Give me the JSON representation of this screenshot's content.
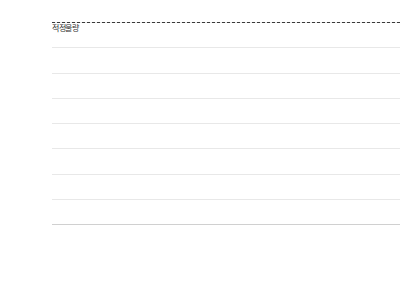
{
  "chart_data": {
    "type": "bar",
    "title": "",
    "xlabel": "",
    "ylabel": "",
    "ylim": [
      0,
      40000
    ],
    "ytick_step": 5000,
    "grid": true,
    "legend": "none",
    "bar_color": "#6b6b6b",
    "categories": [
      "2010년",
      "2011년",
      "2012년",
      "2013년",
      "2014년",
      "2015년",
      "2016년",
      "2017년",
      "2018년",
      "2019년",
      "2020년",
      "2021년",
      "2022년",
      "2023년",
      "2024년",
      "2025년",
      "2026년",
      "2027년",
      "2028년",
      "미정"
    ],
    "values": [
      9600,
      8000,
      4100,
      12100,
      5500,
      14200,
      21800,
      17400,
      11800,
      6300,
      13900,
      16600,
      19800,
      24600,
      23800,
      9800,
      6800,
      12000,
      3300,
      28000
    ],
    "ytick_labels": [
      "40,000",
      "35,000",
      "30,000",
      "25,000",
      "20,000",
      "15,000",
      "10,000",
      "5,000",
      "0"
    ],
    "ytick_values": [
      40000,
      35000,
      30000,
      25000,
      20000,
      15000,
      10000,
      5000,
      0
    ],
    "annotations": [
      {
        "name": "적정물량",
        "type": "horizontal-reference-line",
        "value": 11500,
        "style": "dashed",
        "color": "#3a3a3a",
        "label": "적정물량"
      }
    ]
  }
}
